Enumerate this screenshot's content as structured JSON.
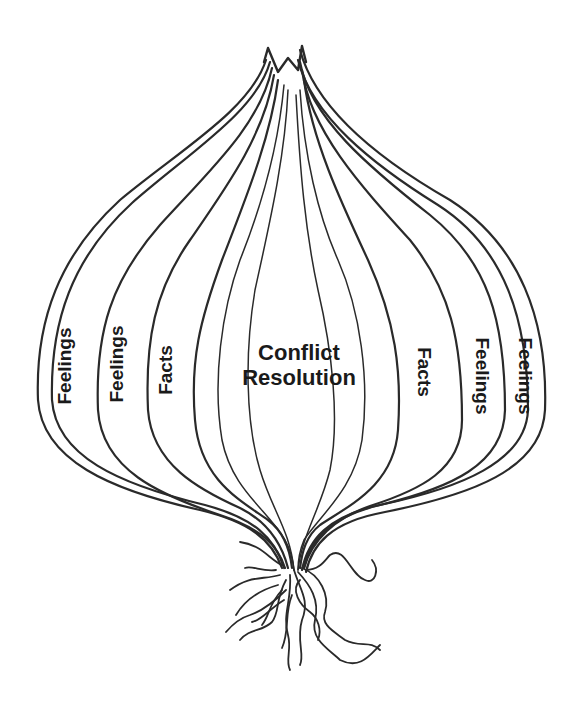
{
  "diagram": {
    "type": "onion-layers",
    "core_label_line1": "Conflict",
    "core_label_line2": "Resolution",
    "left_layers": [
      {
        "label": "Feelings",
        "orientation": "rotated-up"
      },
      {
        "label": "Feelings",
        "orientation": "rotated-up"
      },
      {
        "label": "Facts",
        "orientation": "rotated-up"
      }
    ],
    "right_layers": [
      {
        "label": "Facts",
        "orientation": "rotated-down"
      },
      {
        "label": "Feelings",
        "orientation": "rotated-down"
      },
      {
        "label": "Feelings",
        "orientation": "rotated-down"
      }
    ],
    "colors": {
      "line": "#2a2a2a",
      "text": "#1a1a1a",
      "background": "#ffffff"
    }
  }
}
